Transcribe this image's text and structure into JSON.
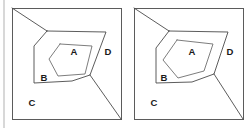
{
  "figure": {
    "title": "",
    "caption": "",
    "background_color": "#ffffff",
    "stroke_color": "#4a4a4a",
    "frame_color": "#5b5b5b",
    "label_color": "#1a1a1a",
    "margin_rule_color": "#d8d8d8"
  },
  "panels": [
    {
      "id": "panel-left",
      "name": "left-diagram",
      "frame": {
        "x": 0,
        "y": 0,
        "width": 109,
        "height": 111
      },
      "labels": [
        {
          "key": "A",
          "text": "A",
          "x": 62,
          "y": 44
        },
        {
          "key": "B",
          "text": "B",
          "x": 32,
          "y": 70
        },
        {
          "key": "C",
          "text": "C",
          "x": 20,
          "y": 95
        },
        {
          "key": "D",
          "text": "D",
          "x": 96,
          "y": 44
        }
      ],
      "paths": {
        "corner_diagonal": "M 0 0 L 35 23",
        "outer_region": "M 35 23 L 22 38 L 22 75 L 60 73 L 78 67 L 94 24 L 35 23 Z",
        "inner_region": "M 48 36 L 37 51 L 46 68 L 73 66 L 80 38 L 48 36 Z",
        "junction_to_corner": "M 78 67 L 109 111",
        "junction_to_bottom": "M 78 67 L 60 73"
      }
    },
    {
      "id": "panel-right",
      "name": "right-diagram",
      "frame": {
        "x": 0,
        "y": 0,
        "width": 109,
        "height": 111
      },
      "labels": [
        {
          "key": "A",
          "text": "A",
          "x": 58,
          "y": 44
        },
        {
          "key": "B",
          "text": "B",
          "x": 30,
          "y": 70
        },
        {
          "key": "C",
          "text": "C",
          "x": 20,
          "y": 95
        },
        {
          "key": "D",
          "text": "D",
          "x": 96,
          "y": 44
        }
      ],
      "paths": {
        "corner_diagonal": "M 0 0 L 35 23",
        "outer_region": "M 35 23 L 22 40 L 22 75 L 58 74 L 80 66 L 94 24 L 35 23 Z",
        "inner_region": "M 43 32 L 29 52 L 44 70 L 70 63 L 79 36 L 43 32 Z",
        "junction_to_corner": "M 80 66 L 109 111",
        "junction_to_bottom": "M 80 66 L 58 74"
      }
    }
  ],
  "regions": {
    "A": {
      "label": "A",
      "description": "innermost region"
    },
    "B": {
      "label": "B",
      "description": "ring region between inner and outer polygon"
    },
    "C": {
      "label": "C",
      "description": "lower-left outer region"
    },
    "D": {
      "label": "D",
      "description": "right outer region"
    }
  }
}
